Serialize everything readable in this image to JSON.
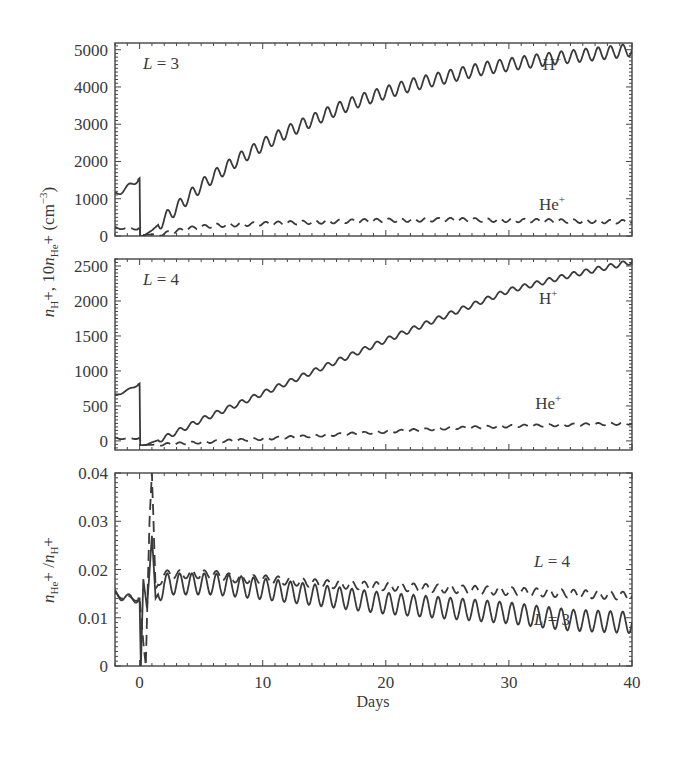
{
  "figure": {
    "xlabel": "Days",
    "ylabel_top": "n_H+, 10n_He+ (cm^-3)",
    "ylabel_bottom": "n_He+ / n_H+"
  },
  "chart_data": [
    {
      "type": "line",
      "panel_label": "L = 3",
      "xlabel": "Days",
      "ylabel": "n_H+, 10n_He+ (cm^-3)",
      "xlim": [
        -2,
        40
      ],
      "ylim": [
        0,
        5180
      ],
      "xticks": [
        0,
        10,
        20,
        30,
        40
      ],
      "yticks": [
        0,
        1000,
        2000,
        3000,
        4000,
        5000
      ],
      "grid": false,
      "series": [
        {
          "name": "H+",
          "style": "solid",
          "label_pos": [
            33.5,
            4450
          ],
          "x": [
            -2,
            -1,
            0,
            0.05,
            0.3,
            1,
            2,
            3,
            4,
            5,
            6,
            8,
            10,
            12,
            14,
            16,
            18,
            20,
            22,
            24,
            26,
            28,
            30,
            32,
            34,
            36,
            38,
            40
          ],
          "y": [
            1100,
            1300,
            1550,
            0,
            0,
            150,
            450,
            750,
            1050,
            1350,
            1600,
            2050,
            2450,
            2800,
            3100,
            3400,
            3650,
            3850,
            4050,
            4200,
            4350,
            4500,
            4600,
            4700,
            4780,
            4850,
            4920,
            5000
          ],
          "ripple": 170
        },
        {
          "name": "He+",
          "style": "dashed",
          "label_pos": [
            33.5,
            700
          ],
          "x": [
            -2,
            -1,
            0,
            0.2,
            1,
            2,
            4,
            6,
            10,
            15,
            20,
            25,
            30,
            35,
            40
          ],
          "y": [
            220,
            200,
            200,
            30,
            40,
            60,
            200,
            280,
            330,
            380,
            420,
            440,
            420,
            400,
            380
          ],
          "ripple": 70
        }
      ]
    },
    {
      "type": "line",
      "panel_label": "L = 4",
      "xlabel": "Days",
      "ylabel": "n_H+, 10n_He+ (cm^-3)",
      "xlim": [
        -2,
        40
      ],
      "ylim": [
        -130,
        2600
      ],
      "xticks": [
        0,
        10,
        20,
        30,
        40
      ],
      "yticks": [
        0,
        500,
        1000,
        1500,
        2000,
        2500
      ],
      "grid": false,
      "series": [
        {
          "name": "H+",
          "style": "solid",
          "label_pos": [
            33.2,
            1950
          ],
          "x": [
            -2,
            -1,
            0,
            0.05,
            0.5,
            1,
            2,
            5,
            10,
            15,
            20,
            25,
            30,
            35,
            40
          ],
          "y": [
            650,
            720,
            820,
            -60,
            -60,
            -20,
            40,
            300,
            680,
            1060,
            1440,
            1800,
            2150,
            2370,
            2560
          ],
          "ripple": 35
        },
        {
          "name": "He+",
          "style": "dashed",
          "label_pos": [
            33.2,
            450
          ],
          "x": [
            -2,
            -1,
            0,
            0.2,
            2,
            5,
            10,
            15,
            20,
            25,
            30,
            35,
            40
          ],
          "y": [
            40,
            30,
            40,
            -60,
            -50,
            -20,
            30,
            80,
            130,
            180,
            210,
            230,
            250
          ],
          "ripple": 25
        }
      ]
    },
    {
      "type": "line",
      "panel_label": "",
      "xlabel": "Days",
      "ylabel": "n_He+ / n_H+",
      "xlim": [
        -2,
        40
      ],
      "ylim": [
        0,
        0.04
      ],
      "xticks": [
        0,
        10,
        20,
        30,
        40
      ],
      "xticklabels": [
        "0",
        "10",
        "20",
        "30",
        "40"
      ],
      "yticks": [
        0,
        0.01,
        0.02,
        0.03,
        0.04
      ],
      "yticklabels": [
        "0",
        "0.01",
        "0.02",
        "0.03",
        "0.04"
      ],
      "grid": false,
      "series": [
        {
          "name": "L = 4",
          "style": "dashed",
          "label_pos": [
            33.5,
            0.0205
          ],
          "x": [
            -2,
            -1,
            0,
            0.3,
            0.5,
            0.8,
            1.0,
            1.3,
            2,
            4,
            6,
            8,
            10,
            15,
            20,
            25,
            30,
            35,
            40
          ],
          "y": [
            0.015,
            0.014,
            0.014,
            0.005,
            0.0,
            0.03,
            0.04,
            0.016,
            0.019,
            0.019,
            0.019,
            0.018,
            0.018,
            0.017,
            0.0165,
            0.016,
            0.0155,
            0.015,
            0.0145
          ],
          "ripple": 0.0012
        },
        {
          "name": "L = 3",
          "style": "solid",
          "label_pos": [
            33.5,
            0.0085
          ],
          "x": [
            -2,
            -1,
            0,
            0.1,
            0.3,
            0.6,
            1.0,
            1.3,
            2,
            4,
            6,
            8,
            10,
            15,
            20,
            25,
            30,
            35,
            40
          ],
          "y": [
            0.015,
            0.014,
            0.014,
            0.0,
            0.018,
            0.012,
            0.027,
            0.014,
            0.017,
            0.017,
            0.017,
            0.0165,
            0.016,
            0.0145,
            0.013,
            0.012,
            0.011,
            0.0095,
            0.009
          ],
          "ripple": 0.0022
        }
      ]
    }
  ]
}
